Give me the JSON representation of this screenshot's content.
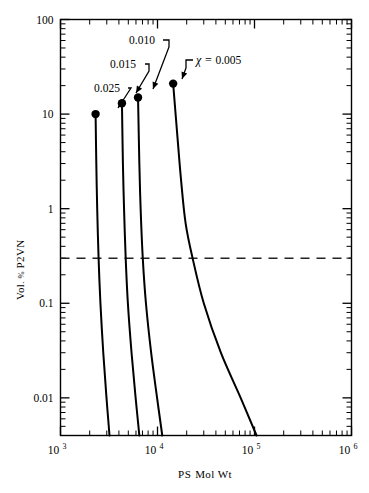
{
  "chart_data": {
    "type": "line",
    "title": "",
    "subtitle": "",
    "xlabel_parts": {
      "lead": "PS",
      "rest": "Mol Wt"
    },
    "xlabel": "PS Mol Wt",
    "ylabel_parts": {
      "lead": "Vol",
      "mid": ". % ",
      "rest": "P2VN"
    },
    "ylabel": "Vol. % P2VN",
    "xscale": "log",
    "yscale": "log",
    "xlim": [
      1000,
      1000000
    ],
    "ylim": [
      0.004,
      100
    ],
    "grid": false,
    "legend": "none (curves labeled inline with leader arrows)",
    "xticks": [
      {
        "value": 1000,
        "base": "10",
        "exp": "3"
      },
      {
        "value": 10000,
        "base": "10",
        "exp": "4"
      },
      {
        "value": 100000,
        "base": "10",
        "exp": "5"
      },
      {
        "value": 1000000,
        "base": "10",
        "exp": "6"
      }
    ],
    "yticks": [
      {
        "value": 100,
        "label": "100"
      },
      {
        "value": 10,
        "label": "10"
      },
      {
        "value": 1,
        "label": "1"
      },
      {
        "value": 0.1,
        "label": "0.1"
      },
      {
        "value": 0.01,
        "label": "0.01"
      }
    ],
    "annotations": [
      {
        "id": "chi-0005",
        "text": "0.005",
        "prefix": "χ  =  ",
        "has_chi_prefix": true,
        "label_x": 196,
        "label_y": 64,
        "elbow": [
          [
            193,
            60
          ],
          [
            186,
            60
          ],
          [
            186,
            68
          ],
          [
            182,
            79
          ]
        ],
        "arrow_tip": [
          182,
          79
        ]
      },
      {
        "id": "chi-0010",
        "text": "0.010",
        "has_chi_prefix": false,
        "label_x": 129,
        "label_y": 44,
        "elbow": [
          [
            163,
            40
          ],
          [
            169,
            40
          ],
          [
            169,
            47
          ],
          [
            153,
            89
          ]
        ],
        "arrow_tip": [
          153,
          89
        ]
      },
      {
        "id": "chi-0015",
        "text": "0.015",
        "has_chi_prefix": false,
        "label_x": 110,
        "label_y": 68,
        "elbow": [
          [
            145,
            64
          ],
          [
            149,
            64
          ],
          [
            149,
            71
          ],
          [
            136,
            93
          ]
        ],
        "arrow_tip": [
          136,
          93
        ]
      },
      {
        "id": "chi-0025",
        "text": "0.025",
        "has_chi_prefix": false,
        "label_x": 94,
        "label_y": 92,
        "elbow": [
          [
            128,
            88
          ],
          [
            131,
            88
          ],
          [
            118,
            108
          ]
        ],
        "arrow_tip": [
          118,
          108
        ]
      }
    ],
    "threshold_line": {
      "style": "dashed",
      "orientation": "horizontal",
      "y_value": 0.3,
      "spans_full_width": true
    },
    "series": [
      {
        "name": "chi = 0.025",
        "chi": 0.025,
        "marker_point": {
          "x": 2300,
          "y": 10
        },
        "points": [
          {
            "x": 2300,
            "y": 10
          },
          {
            "x": 2340,
            "y": 3.0
          },
          {
            "x": 2390,
            "y": 1.0
          },
          {
            "x": 2470,
            "y": 0.3
          },
          {
            "x": 2580,
            "y": 0.1
          },
          {
            "x": 2760,
            "y": 0.03
          },
          {
            "x": 2980,
            "y": 0.01
          },
          {
            "x": 3200,
            "y": 0.004
          }
        ]
      },
      {
        "name": "chi = 0.015",
        "chi": 0.015,
        "marker_point": {
          "x": 4300,
          "y": 13
        },
        "points": [
          {
            "x": 4300,
            "y": 13
          },
          {
            "x": 4400,
            "y": 3.0
          },
          {
            "x": 4520,
            "y": 1.0
          },
          {
            "x": 4700,
            "y": 0.3
          },
          {
            "x": 4950,
            "y": 0.1
          },
          {
            "x": 5400,
            "y": 0.03
          },
          {
            "x": 5950,
            "y": 0.01
          },
          {
            "x": 6500,
            "y": 0.004
          }
        ]
      },
      {
        "name": "chi = 0.010",
        "chi": 0.01,
        "marker_point": {
          "x": 6300,
          "y": 15
        },
        "points": [
          {
            "x": 6300,
            "y": 15
          },
          {
            "x": 6500,
            "y": 3.0
          },
          {
            "x": 6700,
            "y": 1.0
          },
          {
            "x": 7050,
            "y": 0.3
          },
          {
            "x": 7600,
            "y": 0.1
          },
          {
            "x": 8600,
            "y": 0.03
          },
          {
            "x": 9900,
            "y": 0.01
          },
          {
            "x": 11200,
            "y": 0.004
          }
        ]
      },
      {
        "name": "chi = 0.005",
        "chi": 0.005,
        "marker_point": {
          "x": 14500,
          "y": 21
        },
        "points": [
          {
            "x": 14500,
            "y": 21
          },
          {
            "x": 16000,
            "y": 6.0
          },
          {
            "x": 17500,
            "y": 2.0
          },
          {
            "x": 19500,
            "y": 0.7
          },
          {
            "x": 23000,
            "y": 0.3
          },
          {
            "x": 30000,
            "y": 0.1
          },
          {
            "x": 45000,
            "y": 0.03
          },
          {
            "x": 72000,
            "y": 0.01
          },
          {
            "x": 105000,
            "y": 0.004
          }
        ]
      }
    ]
  },
  "style": {
    "line_color": "#000000",
    "marker_color": "#000000",
    "dash_color": "#222222",
    "axis_color": "#000000",
    "background": "#ffffff"
  }
}
